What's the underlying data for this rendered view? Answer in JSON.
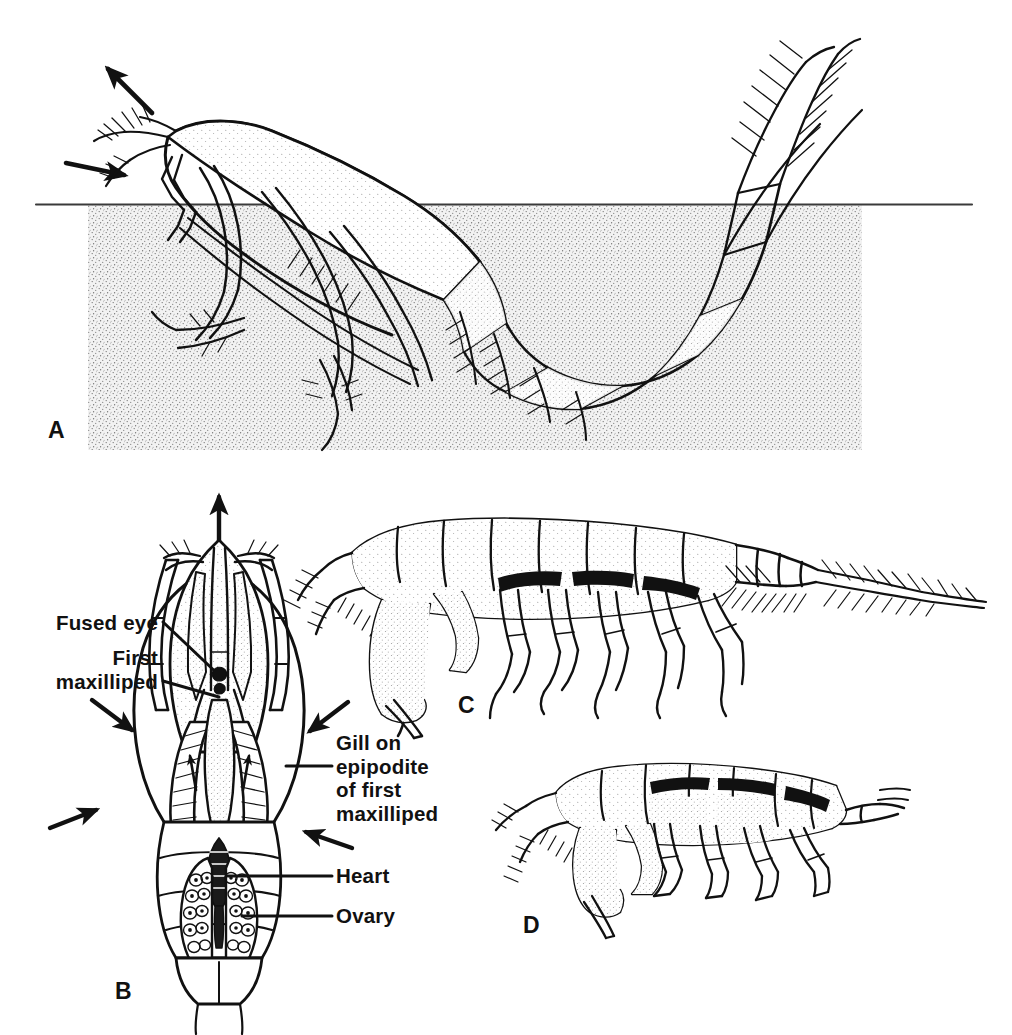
{
  "figure": {
    "background_color": "#ffffff",
    "ink_color": "#111111",
    "substrate_color": "#ebebeb",
    "stipple_color": "#5a5a5a"
  },
  "panels": [
    {
      "id": "A",
      "letter": "A",
      "description": "Lateral view of a burrowing crustacean half buried in stippled sediment, with water-current arrows at the head",
      "letter_x": 48,
      "letter_y": 417,
      "arrows": [
        {
          "name": "exhalant-current-arrow",
          "direction": "up-left"
        },
        {
          "name": "inhalant-current-arrow",
          "direction": "right"
        }
      ]
    },
    {
      "id": "B",
      "letter": "B",
      "description": "Dorsal view of anterior body showing fused eye, first maxilliped, gill on epipodite, heart and ovary",
      "letter_x": 115,
      "letter_y": 978
    },
    {
      "id": "C",
      "letter": "C",
      "description": "Lateral view of a slender segmented crustacean with long plumose tail setae",
      "letter_x": 458,
      "letter_y": 692
    },
    {
      "id": "D",
      "letter": "D",
      "description": "Lateral view of a smaller stout crustacean with large subchelate claw",
      "letter_x": 523,
      "letter_y": 912
    }
  ],
  "labels": [
    {
      "name": "fused-eye",
      "lines": [
        "Fused eye"
      ],
      "align": "right",
      "x": 158,
      "y": 611,
      "leader": {
        "from_x": 163,
        "from_y": 622,
        "to_x": 218,
        "to_y": 676
      }
    },
    {
      "name": "first-maxilliped",
      "lines": [
        "First",
        "maxilliped"
      ],
      "align": "right",
      "x": 158,
      "y": 646,
      "leader": {
        "from_x": 163,
        "from_y": 681,
        "to_x": 216,
        "to_y": 697
      }
    },
    {
      "name": "gill-on-epipodite-of-first-maxilliped",
      "lines": [
        "Gill on",
        "epipodite",
        "of first",
        "maxilliped"
      ],
      "align": "left",
      "x": 336,
      "y": 731,
      "leader": {
        "from_x": 332,
        "from_y": 766,
        "to_x": 288,
        "to_y": 766
      }
    },
    {
      "name": "heart",
      "lines": [
        "Heart"
      ],
      "align": "left",
      "x": 336,
      "y": 864,
      "leader": {
        "from_x": 332,
        "from_y": 876,
        "to_x": 228,
        "to_y": 876
      }
    },
    {
      "name": "ovary",
      "lines": [
        "Ovary"
      ],
      "align": "left",
      "x": 336,
      "y": 904,
      "leader": {
        "from_x": 332,
        "from_y": 916,
        "to_x": 240,
        "to_y": 916
      }
    }
  ],
  "substrate": {
    "name": "sediment-block",
    "x": 88,
    "y": 205,
    "width": 774,
    "height": 245,
    "waterline_y": 204,
    "waterline_x1": 36,
    "waterline_x2": 972
  }
}
